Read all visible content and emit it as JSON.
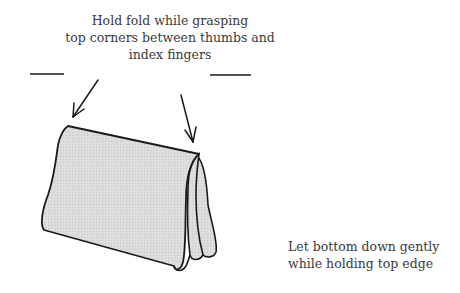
{
  "diagram": {
    "type": "instructional-illustration",
    "top_caption": {
      "lines": [
        "Hold fold while grasping",
        "top corners between thumbs and",
        "index fingers"
      ]
    },
    "bottom_caption": {
      "lines": [
        "Let bottom down gently",
        "while holding top edge"
      ]
    },
    "arrows": [
      {
        "name": "left-arrow",
        "points_to": "top-left corner"
      },
      {
        "name": "right-arrow",
        "points_to": "top-right corner"
      }
    ],
    "colors": {
      "ink": "#1a1a1a",
      "cloth_fill": "#d9d9d9",
      "text": "#3a3a3a",
      "background": "#ffffff"
    }
  }
}
